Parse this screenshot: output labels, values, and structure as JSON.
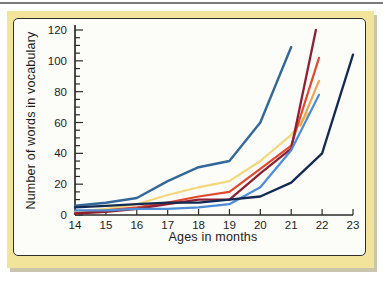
{
  "figure": {
    "x_axis_title": "Ages in months",
    "y_axis_title": "Number of words in vocabulary"
  },
  "colors": {
    "card_background": "#F3E49B",
    "panel_background": "#FCFCF9",
    "panel_border": "#2e2e2c",
    "axis": "#2b2b29",
    "tick_label": "#1d1d1d"
  },
  "chart_data": {
    "type": "line",
    "title": "",
    "xlabel": "Ages in months",
    "ylabel": "Number of words in vocabulary",
    "xlim": [
      14,
      23
    ],
    "ylim": [
      0,
      120
    ],
    "x_major_ticks": [
      14,
      15,
      16,
      17,
      18,
      19,
      20,
      21,
      22,
      23
    ],
    "y_major_ticks": [
      0,
      20,
      40,
      60,
      80,
      100,
      120
    ],
    "y_minor_step": 5,
    "grid": false,
    "legend": false,
    "series": [
      {
        "name": "child-yellow",
        "color": "#F3D77B",
        "width": 2.2,
        "points": [
          [
            14,
            2
          ],
          [
            15,
            4
          ],
          [
            16,
            7
          ],
          [
            17,
            13
          ],
          [
            18,
            18
          ],
          [
            19,
            22
          ],
          [
            20,
            35
          ],
          [
            21,
            52
          ],
          [
            21.55,
            66
          ]
        ]
      },
      {
        "name": "child-orange",
        "color": "#F2A44F",
        "width": 2.2,
        "points": [
          [
            21.3,
            58
          ],
          [
            21.9,
            87
          ]
        ]
      },
      {
        "name": "child-red",
        "color": "#E2492F",
        "width": 2.2,
        "points": [
          [
            14,
            1
          ],
          [
            15,
            3
          ],
          [
            16,
            5
          ],
          [
            17,
            8
          ],
          [
            18,
            12
          ],
          [
            19,
            15
          ],
          [
            20,
            30
          ],
          [
            21,
            45
          ],
          [
            21.9,
            102
          ]
        ]
      },
      {
        "name": "child-maroon",
        "color": "#8F1F33",
        "width": 2.3,
        "points": [
          [
            14,
            1
          ],
          [
            15,
            2
          ],
          [
            16,
            4
          ],
          [
            17,
            7
          ],
          [
            18,
            10
          ],
          [
            19,
            10
          ],
          [
            20,
            27
          ],
          [
            21,
            43
          ],
          [
            21.8,
            120
          ]
        ]
      },
      {
        "name": "child-cornflower",
        "color": "#4D8CD7",
        "width": 2.2,
        "points": [
          [
            14,
            3
          ],
          [
            15,
            3
          ],
          [
            16,
            4
          ],
          [
            17,
            4
          ],
          [
            18,
            5
          ],
          [
            19,
            7
          ],
          [
            20,
            18
          ],
          [
            21,
            42
          ],
          [
            21.9,
            78
          ]
        ]
      },
      {
        "name": "child-steel-blue",
        "color": "#33689B",
        "width": 2.4,
        "points": [
          [
            14,
            6
          ],
          [
            15,
            8
          ],
          [
            16,
            11
          ],
          [
            17,
            22
          ],
          [
            18,
            31
          ],
          [
            19,
            35
          ],
          [
            20,
            60
          ],
          [
            21,
            109
          ]
        ]
      },
      {
        "name": "child-navy",
        "color": "#132A52",
        "width": 2.3,
        "points": [
          [
            14,
            5
          ],
          [
            15,
            6
          ],
          [
            16,
            7
          ],
          [
            17,
            8
          ],
          [
            18,
            8
          ],
          [
            19,
            10
          ],
          [
            20,
            12
          ],
          [
            21,
            21
          ],
          [
            22,
            40
          ],
          [
            23,
            104
          ]
        ]
      }
    ]
  }
}
